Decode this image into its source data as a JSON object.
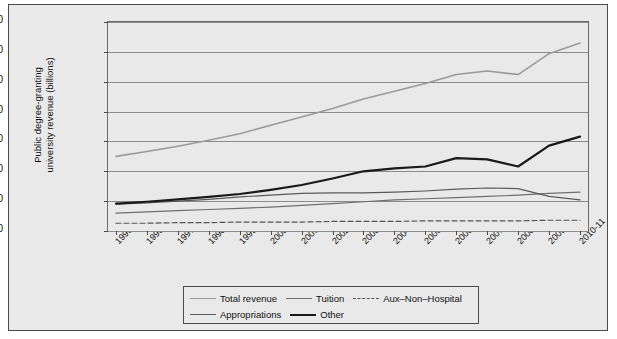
{
  "chart_data": {
    "type": "line",
    "title": "",
    "xlabel": "",
    "ylabel": "Public degree-granting university revenue (billions)",
    "ylabel_line1": "Public degree-granting",
    "ylabel_line2": "university revenue (billions)",
    "ylim": [
      0,
      350
    ],
    "ytick_values": [
      0,
      50,
      100,
      150,
      200,
      250,
      300,
      350
    ],
    "ytick_labels": [
      "$0",
      "$50",
      "$100",
      "$150",
      "$200",
      "$250",
      "$300",
      "$350"
    ],
    "grid": true,
    "legend_position": "bottom",
    "categories": [
      "1995-96",
      "1996-97",
      "1997-98",
      "1998-99",
      "1999-2000",
      "2000-01",
      "2001-02",
      "2002-03",
      "2003-04",
      "2004-05",
      "2005-06",
      "2006-07",
      "2007-08",
      "2008-09",
      "2009-10",
      "2010-11"
    ],
    "series": [
      {
        "name": "Total revenue",
        "color": "#9a9a9a",
        "style": "solid",
        "width": 1.6,
        "values": [
          125,
          133,
          142,
          152,
          163,
          177,
          191,
          205,
          221,
          234,
          247,
          262,
          268,
          262,
          297,
          315
        ]
      },
      {
        "name": "Tuition",
        "color": "#6e6e6e",
        "style": "solid",
        "width": 1.2,
        "values": [
          30,
          32,
          34,
          36,
          38,
          40,
          43,
          46,
          49,
          52,
          54,
          56,
          58,
          60,
          63,
          65
        ]
      },
      {
        "name": "Aux-Non-Hospital",
        "color": "#555555",
        "style": "dashed",
        "width": 1.2,
        "values": [
          13,
          13,
          14,
          14,
          15,
          15,
          15,
          16,
          16,
          16,
          17,
          17,
          17,
          17,
          18,
          18
        ]
      },
      {
        "name": "Appropriations",
        "color": "#5a5a5a",
        "style": "solid",
        "width": 1.2,
        "values": [
          45,
          47,
          50,
          53,
          57,
          60,
          63,
          64,
          64,
          65,
          67,
          70,
          72,
          71,
          58,
          52
        ]
      },
      {
        "name": "Other",
        "color": "#1a1a1a",
        "style": "solid",
        "width": 2.2,
        "values": [
          46,
          49,
          53,
          57,
          62,
          69,
          77,
          88,
          100,
          105,
          108,
          122,
          120,
          108,
          143,
          158
        ]
      }
    ]
  },
  "legend": {
    "row1": [
      {
        "label": "Total revenue",
        "color": "#9a9a9a",
        "style": "solid",
        "width": 1.6
      },
      {
        "label": "Tuition",
        "color": "#6e6e6e",
        "style": "solid",
        "width": 1.2
      },
      {
        "label": "Aux–Non–Hospital",
        "color": "#555555",
        "style": "dashed",
        "width": 1.2
      }
    ],
    "row2": [
      {
        "label": "Appropriations",
        "color": "#5a5a5a",
        "style": "solid",
        "width": 1.2
      },
      {
        "label": "Other",
        "color": "#1a1a1a",
        "style": "solid",
        "width": 2.2
      }
    ]
  },
  "colors": {
    "background": "#e9e9e9",
    "frame": "#4a4a4a",
    "gridline": "#8c8c8c"
  }
}
